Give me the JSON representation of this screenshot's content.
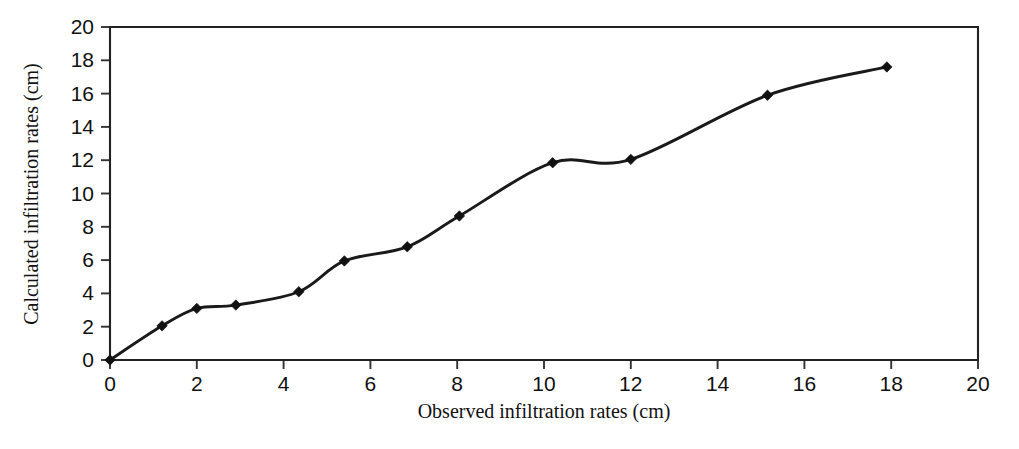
{
  "chart_data": {
    "type": "line",
    "title": "",
    "subtitle": "",
    "xlabel": "Observed infiltration rates (cm)",
    "ylabel": "Calculated infiltration rates (cm)",
    "xlim": [
      0,
      20
    ],
    "ylim": [
      0,
      20
    ],
    "xticks": [
      0,
      2,
      4,
      6,
      8,
      10,
      12,
      14,
      16,
      18,
      20
    ],
    "yticks": [
      0,
      2,
      4,
      6,
      8,
      10,
      12,
      14,
      16,
      18,
      20
    ],
    "xtick_labels": [
      "0",
      "2",
      "4",
      "6",
      "8",
      "10",
      "12",
      "14",
      "16",
      "18",
      "20"
    ],
    "ytick_labels": [
      "0",
      "2",
      "4",
      "6",
      "8",
      "10",
      "12",
      "14",
      "16",
      "18",
      "20"
    ],
    "grid": false,
    "legend": null,
    "legend_position": "none",
    "annotations": [],
    "marker": "diamond",
    "line_color": "#1a1a1a",
    "marker_color": "#111111",
    "series": [
      {
        "name": "Calculated vs observed infiltration",
        "x": [
          0,
          1.2,
          2.0,
          2.9,
          4.35,
          5.4,
          6.85,
          8.05,
          10.2,
          12.0,
          15.15,
          17.9
        ],
        "y": [
          0,
          2.05,
          3.1,
          3.3,
          4.1,
          5.95,
          6.8,
          8.65,
          11.85,
          12.05,
          15.9,
          17.6
        ]
      }
    ]
  }
}
